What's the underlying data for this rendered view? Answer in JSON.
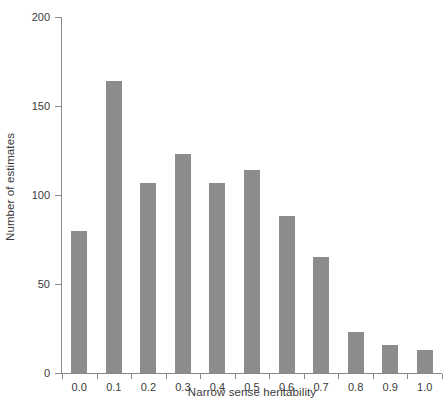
{
  "chart_data": {
    "type": "bar",
    "title": "",
    "subtitle": "",
    "xlabel": "Narrow sense heritability",
    "ylabel": "Number of estimates",
    "categories": [
      "0.0",
      "0.1",
      "0.2",
      "0.3",
      "0.4",
      "0.5",
      "0.6",
      "0.7",
      "0.8",
      "0.9",
      "1.0"
    ],
    "values": [
      80,
      164,
      107,
      123,
      107,
      114,
      88,
      65,
      23,
      16,
      13
    ],
    "ylim": [
      0,
      200
    ],
    "yticks": [
      0,
      50,
      100,
      150,
      200
    ],
    "ytick_labels": [
      "0",
      "50",
      "100",
      "150",
      "200"
    ],
    "xlim": [
      -0.05,
      1.05
    ],
    "grid": false,
    "legend": null,
    "bar_color": "#8c8c8c",
    "axis_color": "#8a8a8a",
    "text_color": "#3b3b3b",
    "background_color": "#ffffff"
  }
}
